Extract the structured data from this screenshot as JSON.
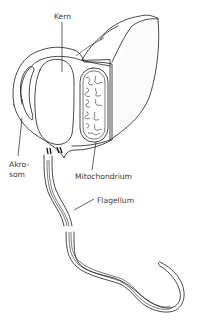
{
  "figure": {
    "labels": {
      "kern": "Kern",
      "akrosom_line1": "Akro-",
      "akrosom_line2": "som",
      "mitochondrium": "Mitochondrium",
      "flagellum": "Flagellum"
    },
    "parts": [
      "head",
      "nucleus",
      "acrosome",
      "mitochondrion",
      "centrioles",
      "flagellum"
    ],
    "colors": {
      "stroke": "#1c1c1c",
      "label": "#3a3a3a",
      "background": "#ffffff",
      "stipple": "#bdbdbd"
    }
  }
}
